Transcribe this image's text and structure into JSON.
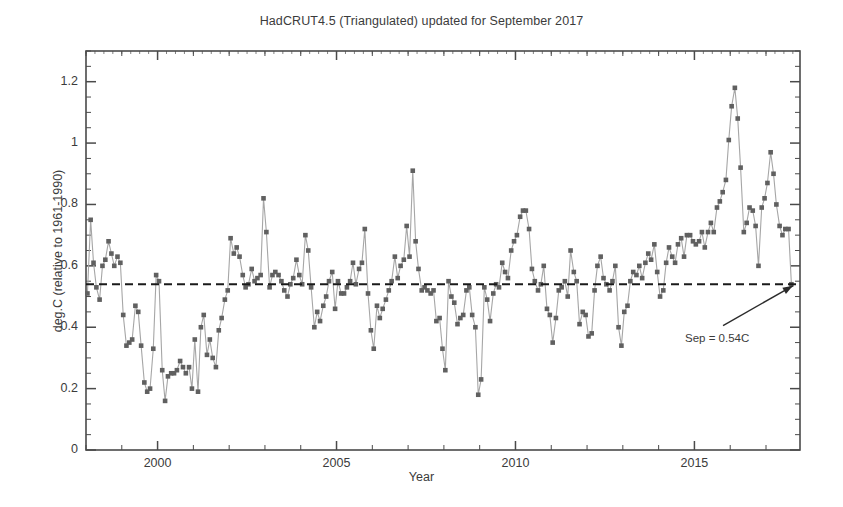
{
  "chart_data": {
    "type": "line",
    "title": "HadCRUT4.5 (Triangulated) updated for September 2017",
    "xlabel": "Year",
    "ylabel": "deg.C (relative to 1961-1990)",
    "xlim": [
      1998.0,
      2017.95
    ],
    "ylim": [
      0,
      1.3
    ],
    "xticks": [
      2000,
      2005,
      2010,
      2015
    ],
    "xtick_labels": [
      "2000",
      "2005",
      "2010",
      "2015"
    ],
    "xtick_minor_step": 1,
    "yticks": [
      0,
      0.2,
      0.4,
      0.6,
      0.8,
      1,
      1.2
    ],
    "ytick_labels": [
      "0",
      "0.2",
      "0.4",
      "0.6",
      "0.8",
      "1",
      "1.2"
    ],
    "ytick_minor_step": 0.05,
    "grid": false,
    "legend": "none",
    "marker": "filled-square",
    "marker_color": "#606060",
    "line_color": "#a6a6a6",
    "frame_color": "#4a4a4a",
    "reference_line": {
      "value": 0.54,
      "style": "dashed",
      "color": "#1a1a1a",
      "label": "Sep = 0.54C"
    },
    "annotation": {
      "text": "Sep = 0.54C",
      "arrow_from_x": 2015.8,
      "arrow_from_y": 0.405,
      "arrow_to_x": 2017.75,
      "arrow_to_y": 0.535
    },
    "series": [
      {
        "name": "HadCRUT4.5 monthly anomaly",
        "x": [
          1998.04,
          1998.13,
          1998.21,
          1998.29,
          1998.38,
          1998.46,
          1998.54,
          1998.63,
          1998.71,
          1998.79,
          1998.88,
          1998.96,
          1999.04,
          1999.13,
          1999.21,
          1999.29,
          1999.38,
          1999.46,
          1999.54,
          1999.63,
          1999.71,
          1999.79,
          1999.88,
          1999.96,
          2000.04,
          2000.13,
          2000.21,
          2000.29,
          2000.38,
          2000.46,
          2000.54,
          2000.63,
          2000.71,
          2000.79,
          2000.88,
          2000.96,
          2001.04,
          2001.13,
          2001.21,
          2001.29,
          2001.38,
          2001.46,
          2001.54,
          2001.63,
          2001.71,
          2001.79,
          2001.88,
          2001.96,
          2002.04,
          2002.13,
          2002.21,
          2002.29,
          2002.38,
          2002.46,
          2002.54,
          2002.63,
          2002.71,
          2002.79,
          2002.88,
          2002.96,
          2003.04,
          2003.13,
          2003.21,
          2003.29,
          2003.38,
          2003.46,
          2003.54,
          2003.63,
          2003.71,
          2003.79,
          2003.88,
          2003.96,
          2004.04,
          2004.13,
          2004.21,
          2004.29,
          2004.38,
          2004.46,
          2004.54,
          2004.63,
          2004.71,
          2004.79,
          2004.88,
          2004.96,
          2005.04,
          2005.13,
          2005.21,
          2005.29,
          2005.38,
          2005.46,
          2005.54,
          2005.63,
          2005.71,
          2005.79,
          2005.88,
          2005.96,
          2006.04,
          2006.13,
          2006.21,
          2006.29,
          2006.38,
          2006.46,
          2006.54,
          2006.63,
          2006.71,
          2006.79,
          2006.88,
          2006.96,
          2007.04,
          2007.13,
          2007.21,
          2007.29,
          2007.38,
          2007.46,
          2007.54,
          2007.63,
          2007.71,
          2007.79,
          2007.88,
          2007.96,
          2008.04,
          2008.13,
          2008.21,
          2008.29,
          2008.38,
          2008.46,
          2008.54,
          2008.63,
          2008.71,
          2008.79,
          2008.88,
          2008.96,
          2009.04,
          2009.13,
          2009.21,
          2009.29,
          2009.38,
          2009.46,
          2009.54,
          2009.63,
          2009.71,
          2009.79,
          2009.88,
          2009.96,
          2010.04,
          2010.13,
          2010.21,
          2010.29,
          2010.38,
          2010.46,
          2010.54,
          2010.63,
          2010.71,
          2010.79,
          2010.88,
          2010.96,
          2011.04,
          2011.13,
          2011.21,
          2011.29,
          2011.38,
          2011.46,
          2011.54,
          2011.63,
          2011.71,
          2011.79,
          2011.88,
          2011.96,
          2012.04,
          2012.13,
          2012.21,
          2012.29,
          2012.38,
          2012.46,
          2012.54,
          2012.63,
          2012.71,
          2012.79,
          2012.88,
          2012.96,
          2013.04,
          2013.13,
          2013.21,
          2013.29,
          2013.38,
          2013.46,
          2013.54,
          2013.63,
          2013.71,
          2013.79,
          2013.88,
          2013.96,
          2014.04,
          2014.13,
          2014.21,
          2014.29,
          2014.38,
          2014.46,
          2014.54,
          2014.63,
          2014.71,
          2014.79,
          2014.88,
          2014.96,
          2015.04,
          2015.13,
          2015.21,
          2015.29,
          2015.38,
          2015.46,
          2015.54,
          2015.63,
          2015.71,
          2015.79,
          2015.88,
          2015.96,
          2016.04,
          2016.13,
          2016.21,
          2016.29,
          2016.38,
          2016.46,
          2016.54,
          2016.63,
          2016.71,
          2016.79,
          2016.88,
          2016.96,
          2017.04,
          2017.13,
          2017.21,
          2017.29,
          2017.38,
          2017.46,
          2017.54,
          2017.63,
          2017.71
        ],
        "y": [
          0.51,
          0.75,
          0.61,
          0.53,
          0.49,
          0.6,
          0.62,
          0.68,
          0.64,
          0.6,
          0.63,
          0.61,
          0.44,
          0.34,
          0.35,
          0.36,
          0.47,
          0.45,
          0.34,
          0.22,
          0.19,
          0.2,
          0.33,
          0.57,
          0.55,
          0.26,
          0.16,
          0.24,
          0.25,
          0.25,
          0.26,
          0.29,
          0.27,
          0.25,
          0.27,
          0.2,
          0.36,
          0.19,
          0.4,
          0.44,
          0.31,
          0.36,
          0.3,
          0.27,
          0.39,
          0.43,
          0.49,
          0.52,
          0.69,
          0.64,
          0.66,
          0.63,
          0.57,
          0.53,
          0.54,
          0.59,
          0.55,
          0.56,
          0.57,
          0.82,
          0.71,
          0.53,
          0.57,
          0.58,
          0.57,
          0.55,
          0.52,
          0.5,
          0.54,
          0.56,
          0.62,
          0.57,
          0.54,
          0.7,
          0.65,
          0.53,
          0.4,
          0.45,
          0.42,
          0.47,
          0.5,
          0.55,
          0.58,
          0.46,
          0.55,
          0.51,
          0.51,
          0.53,
          0.55,
          0.61,
          0.54,
          0.59,
          0.61,
          0.72,
          0.51,
          0.39,
          0.33,
          0.47,
          0.43,
          0.46,
          0.49,
          0.52,
          0.55,
          0.63,
          0.56,
          0.6,
          0.62,
          0.73,
          0.63,
          0.91,
          0.68,
          0.59,
          0.52,
          0.53,
          0.52,
          0.51,
          0.52,
          0.42,
          0.43,
          0.33,
          0.26,
          0.55,
          0.5,
          0.48,
          0.41,
          0.43,
          0.44,
          0.52,
          0.53,
          0.44,
          0.4,
          0.18,
          0.23,
          0.53,
          0.49,
          0.42,
          0.51,
          0.54,
          0.53,
          0.61,
          0.58,
          0.56,
          0.65,
          0.68,
          0.7,
          0.76,
          0.78,
          0.78,
          0.72,
          0.59,
          0.55,
          0.52,
          0.54,
          0.6,
          0.46,
          0.44,
          0.35,
          0.43,
          0.52,
          0.53,
          0.55,
          0.5,
          0.65,
          0.58,
          0.55,
          0.41,
          0.45,
          0.44,
          0.37,
          0.38,
          0.52,
          0.6,
          0.63,
          0.56,
          0.54,
          0.52,
          0.55,
          0.6,
          0.4,
          0.34,
          0.45,
          0.47,
          0.55,
          0.58,
          0.57,
          0.6,
          0.56,
          0.61,
          0.64,
          0.62,
          0.67,
          0.58,
          0.5,
          0.52,
          0.61,
          0.66,
          0.63,
          0.61,
          0.67,
          0.69,
          0.63,
          0.7,
          0.7,
          0.68,
          0.67,
          0.68,
          0.71,
          0.66,
          0.71,
          0.74,
          0.71,
          0.79,
          0.81,
          0.84,
          0.88,
          1.01,
          1.12,
          1.18,
          1.08,
          0.92,
          0.71,
          0.74,
          0.79,
          0.78,
          0.73,
          0.6,
          0.79,
          0.82,
          0.87,
          0.97,
          0.9,
          0.8,
          0.73,
          0.7,
          0.72,
          0.72,
          0.54
        ]
      }
    ]
  },
  "axes": {
    "plot_left": 86,
    "plot_right": 800,
    "plot_top": 51,
    "plot_bottom": 450
  }
}
